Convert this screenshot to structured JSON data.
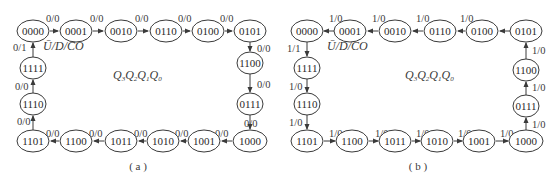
{
  "diagrams": [
    {
      "id": "a",
      "caption": "( a )",
      "center_label": {
        "Q": "Q",
        "subs": [
          "3",
          "2",
          "1",
          "0"
        ]
      },
      "io_label": "Ū/D/CO",
      "direction": "clockwise (count up)",
      "nodes": [
        {
          "id": "a0",
          "label": "0000",
          "x": 33,
          "y": 31
        },
        {
          "id": "a1",
          "label": "0001",
          "x": 76,
          "y": 31
        },
        {
          "id": "a2",
          "label": "0010",
          "x": 121,
          "y": 31
        },
        {
          "id": "a3",
          "label": "0110",
          "x": 166,
          "y": 31
        },
        {
          "id": "a4",
          "label": "0100",
          "x": 208,
          "y": 31
        },
        {
          "id": "a5",
          "label": "0101",
          "x": 250,
          "y": 31
        },
        {
          "id": "a6",
          "label": "1100",
          "x": 250,
          "y": 63
        },
        {
          "id": "a7",
          "label": "0111",
          "x": 250,
          "y": 104
        },
        {
          "id": "a8",
          "label": "1000",
          "x": 250,
          "y": 141
        },
        {
          "id": "a9",
          "label": "1001",
          "x": 204,
          "y": 141
        },
        {
          "id": "a10",
          "label": "1010",
          "x": 163,
          "y": 141
        },
        {
          "id": "a11",
          "label": "1011",
          "x": 121,
          "y": 141
        },
        {
          "id": "a12",
          "label": "1100",
          "x": 76,
          "y": 141
        },
        {
          "id": "a13",
          "label": "1101",
          "x": 33,
          "y": 141
        },
        {
          "id": "a14",
          "label": "1110",
          "x": 33,
          "y": 104
        },
        {
          "id": "a15",
          "label": "1111",
          "x": 33,
          "y": 68
        }
      ],
      "edges": [
        {
          "from": "a0",
          "to": "a1",
          "label": "0/0"
        },
        {
          "from": "a1",
          "to": "a2",
          "label": "0/0"
        },
        {
          "from": "a2",
          "to": "a3",
          "label": "0/0"
        },
        {
          "from": "a3",
          "to": "a4",
          "label": "0/0"
        },
        {
          "from": "a4",
          "to": "a5",
          "label": "0/0"
        },
        {
          "from": "a5",
          "to": "a6",
          "label": "0/0"
        },
        {
          "from": "a6",
          "to": "a7",
          "label": "0/0"
        },
        {
          "from": "a7",
          "to": "a8",
          "label": "0/0"
        },
        {
          "from": "a8",
          "to": "a9",
          "label": "0/0"
        },
        {
          "from": "a9",
          "to": "a10",
          "label": "0/0"
        },
        {
          "from": "a10",
          "to": "a11",
          "label": "0/0"
        },
        {
          "from": "a11",
          "to": "a12",
          "label": "0/0"
        },
        {
          "from": "a12",
          "to": "a13",
          "label": "0/0"
        },
        {
          "from": "a13",
          "to": "a14",
          "label": "0/0"
        },
        {
          "from": "a14",
          "to": "a15",
          "label": "0/0"
        },
        {
          "from": "a15",
          "to": "a0",
          "label": "0/1"
        }
      ]
    },
    {
      "id": "b",
      "caption": "( b )",
      "center_label": {
        "Q": "Q",
        "subs": [
          "3",
          "2",
          "1",
          "0"
        ]
      },
      "io_label": "Ū/D/CO",
      "direction": "counter-clockwise (count down)",
      "nodes": [
        {
          "id": "b0",
          "label": "0000",
          "x": 307,
          "y": 31
        },
        {
          "id": "b1",
          "label": "0001",
          "x": 350,
          "y": 31
        },
        {
          "id": "b2",
          "label": "0010",
          "x": 395,
          "y": 31
        },
        {
          "id": "b3",
          "label": "0110",
          "x": 440,
          "y": 31
        },
        {
          "id": "b4",
          "label": "0100",
          "x": 482,
          "y": 31
        },
        {
          "id": "b5",
          "label": "0101",
          "x": 526,
          "y": 31
        },
        {
          "id": "b6",
          "label": "1100",
          "x": 526,
          "y": 70
        },
        {
          "id": "b7",
          "label": "0111",
          "x": 526,
          "y": 106
        },
        {
          "id": "b8",
          "label": "1000",
          "x": 526,
          "y": 141
        },
        {
          "id": "b9",
          "label": "1001",
          "x": 479,
          "y": 141
        },
        {
          "id": "b10",
          "label": "1010",
          "x": 437,
          "y": 141
        },
        {
          "id": "b11",
          "label": "1011",
          "x": 395,
          "y": 141
        },
        {
          "id": "b12",
          "label": "1100",
          "x": 352,
          "y": 141
        },
        {
          "id": "b13",
          "label": "1101",
          "x": 307,
          "y": 141
        },
        {
          "id": "b14",
          "label": "1110",
          "x": 307,
          "y": 104
        },
        {
          "id": "b15",
          "label": "1111",
          "x": 307,
          "y": 68
        }
      ],
      "edges": [
        {
          "from": "b1",
          "to": "b0",
          "label": "1/0"
        },
        {
          "from": "b2",
          "to": "b1",
          "label": "1/0"
        },
        {
          "from": "b3",
          "to": "b2",
          "label": "1/0"
        },
        {
          "from": "b4",
          "to": "b3",
          "label": "1/0"
        },
        {
          "from": "b5",
          "to": "b4",
          "label": ""
        },
        {
          "from": "b6",
          "to": "b5",
          "label": "1/0"
        },
        {
          "from": "b7",
          "to": "b6",
          "label": "1/0"
        },
        {
          "from": "b8",
          "to": "b7",
          "label": "1/0"
        },
        {
          "from": "b9",
          "to": "b8",
          "label": "1/0"
        },
        {
          "from": "b10",
          "to": "b9",
          "label": "1/0"
        },
        {
          "from": "b11",
          "to": "b10",
          "label": "1/0"
        },
        {
          "from": "b12",
          "to": "b11",
          "label": "1/0"
        },
        {
          "from": "b13",
          "to": "b12",
          "label": "1/0"
        },
        {
          "from": "b14",
          "to": "b13",
          "label": "1/0"
        },
        {
          "from": "b15",
          "to": "b14",
          "label": "1/0"
        },
        {
          "from": "b0",
          "to": "b15",
          "label": "1/1"
        }
      ]
    }
  ]
}
